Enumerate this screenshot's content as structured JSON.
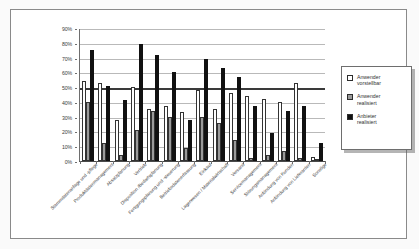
{
  "chart_data": {
    "type": "bar",
    "title": "",
    "xlabel": "",
    "ylabel": "",
    "ylim": [
      0,
      90
    ],
    "ytick_labels": [
      "0%",
      "10%",
      "20%",
      "30%",
      "40%",
      "50%",
      "60%",
      "70%",
      "80%",
      "90%"
    ],
    "ytick_values": [
      0,
      10,
      20,
      30,
      40,
      50,
      60,
      70,
      80,
      90
    ],
    "grid": true,
    "emphasis_line": 50,
    "legend_position": "right",
    "categories": [
      "Stammdatenanlage und -pflege",
      "Produktdatenmanagement",
      "Absatzplanung",
      "Vertrieb",
      "Disposition /Bedarfsplanung",
      "Fertigungsplanung und -steuerung",
      "Betriebsdatenerfassung",
      "Einkauf",
      "Lagerwesen / Materialwirtschaft",
      "Versand",
      "Servicemanagement",
      "Störungsmanagement",
      "Anbindung von Kunden",
      "Anbindung von Lieferanten",
      "Sonstige"
    ],
    "series": [
      {
        "name": "Anwender vorstellbar",
        "color": "#ffffff",
        "values": [
          54,
          53,
          28,
          50,
          35,
          37,
          33,
          48,
          35,
          46,
          44,
          42,
          40,
          53,
          3
        ]
      },
      {
        "name": "Anwender realisiert",
        "color": "#9a9a9a",
        "values": [
          40,
          12,
          4,
          21,
          34,
          30,
          9,
          30,
          26,
          14,
          2,
          4,
          7,
          2,
          0
        ]
      },
      {
        "name": "Anbieter realisiert",
        "color": "#111111",
        "values": [
          75,
          51,
          41,
          79,
          72,
          60,
          28,
          69,
          63,
          57,
          37,
          19,
          34,
          37,
          12
        ]
      }
    ]
  },
  "legend": {
    "items": [
      {
        "label": "Anwender\nvorstellbar",
        "swatch": "white-square-icon"
      },
      {
        "label": "Anwender\nrealisiert",
        "swatch": "gray-square-icon"
      },
      {
        "label": "Anbieter\nrealisiert",
        "swatch": "black-square-icon"
      }
    ]
  }
}
